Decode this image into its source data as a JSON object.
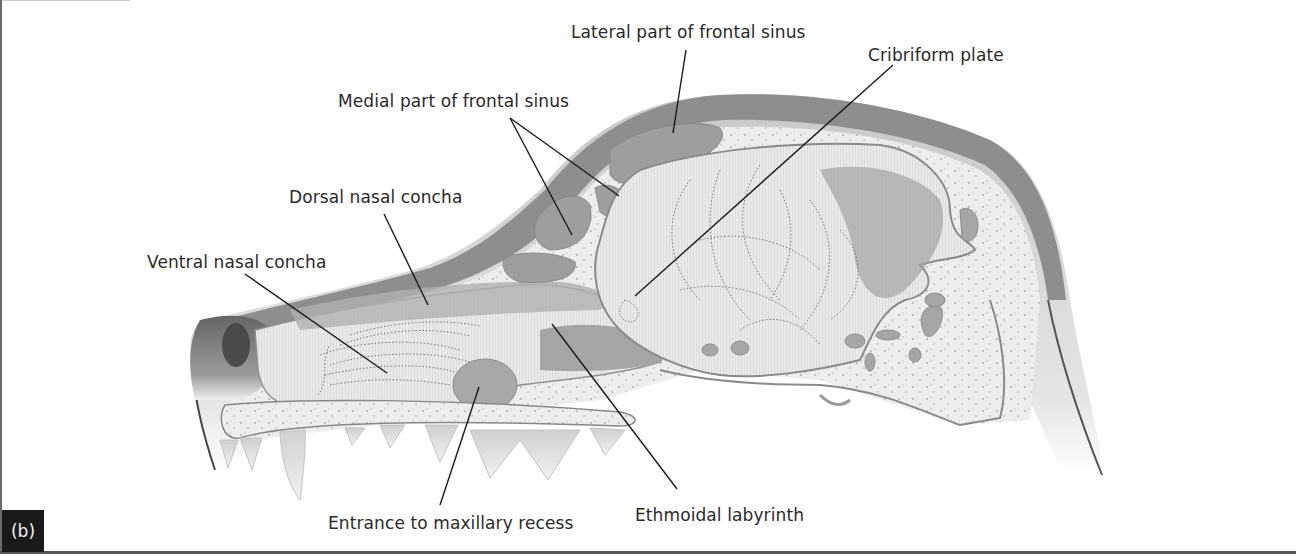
{
  "figure": {
    "panel_label": "(b)",
    "labels": [
      {
        "id": "lateral-frontal-sinus",
        "text": "Lateral part of frontal sinus"
      },
      {
        "id": "cribriform-plate",
        "text": "Cribriform plate"
      },
      {
        "id": "medial-frontal-sinus",
        "text": "Medial part of frontal sinus"
      },
      {
        "id": "dorsal-nasal-concha",
        "text": "Dorsal nasal concha"
      },
      {
        "id": "ventral-nasal-concha",
        "text": "Ventral nasal concha"
      },
      {
        "id": "entrance-maxillary-recess",
        "text": "Entrance to maxillary recess"
      },
      {
        "id": "ethmoidal-labyrinth",
        "text": "Ethmoidal labyrinth"
      }
    ]
  },
  "colors": {
    "bone_outer": "#8a8a8a",
    "bone_fill": "#e6e6e6",
    "cavity_fill": "#bdbdbd",
    "sinus_fill": "#9d9d9d",
    "nose_dark": "#5a5a5a",
    "leader_line": "#1a1a1a",
    "badge_bg": "#1a1a1a"
  }
}
